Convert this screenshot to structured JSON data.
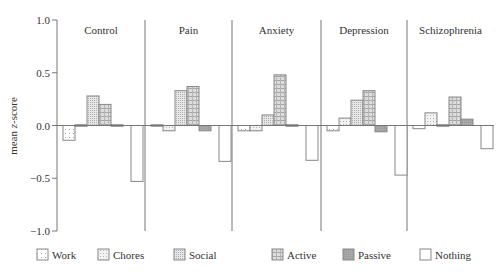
{
  "chart_data": {
    "type": "bar",
    "title": "",
    "xlabel": "",
    "ylabel": "mean z-score",
    "ylim": [
      -1.0,
      1.0
    ],
    "yticks": [
      1.0,
      0.5,
      0.0,
      -0.5,
      -1.0
    ],
    "ytick_labels": [
      "1.0",
      "0.5",
      "0.0",
      "−0.5",
      "−1.0"
    ],
    "grid": false,
    "legend_position": "bottom",
    "categories": [
      "Control",
      "Pain",
      "Anxiety",
      "Depression",
      "Schizophrenia"
    ],
    "series": [
      {
        "name": "Work",
        "pattern": "sparse-dots",
        "values": [
          -0.14,
          -0.01,
          -0.05,
          -0.05,
          -0.03
        ]
      },
      {
        "name": "Chores",
        "pattern": "light-dots",
        "values": [
          -0.01,
          -0.05,
          -0.05,
          0.07,
          0.12
        ]
      },
      {
        "name": "Social",
        "pattern": "medium-dots",
        "values": [
          0.28,
          0.33,
          0.1,
          0.24,
          -0.01
        ]
      },
      {
        "name": "Active",
        "pattern": "grid",
        "values": [
          0.2,
          0.37,
          0.48,
          0.33,
          0.27
        ]
      },
      {
        "name": "Passive",
        "pattern": "dark-gray",
        "values": [
          0.0,
          -0.05,
          0.0,
          -0.06,
          0.06
        ]
      },
      {
        "name": "Nothing",
        "pattern": "white",
        "values": [
          -0.53,
          -0.34,
          -0.33,
          -0.47,
          -0.22
        ]
      }
    ]
  },
  "colors": {
    "axis": "#777777",
    "bar_stroke": "#888888",
    "text": "#333333"
  }
}
